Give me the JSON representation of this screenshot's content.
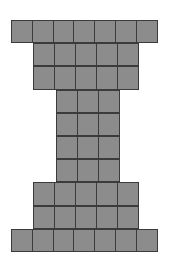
{
  "figure": {
    "name": "i-beam-unit-square-figure",
    "colors": {
      "cell_fill": "#8c8c8c",
      "cell_border": "#3b3b3b",
      "background": "#ffffff"
    },
    "grid": {
      "columns": 7,
      "rows": 10,
      "cell_width_px": 22.43,
      "cell_height_px": 23.2,
      "origin_x_px": 11,
      "origin_y_px": 20
    },
    "total_squares": 46,
    "rows": [
      {
        "row": 1,
        "start_col": 1,
        "cells": 7,
        "label": "top-flange-row-1"
      },
      {
        "row": 2,
        "start_col": 2,
        "cells": 5,
        "label": "top-flange-row-2"
      },
      {
        "row": 3,
        "start_col": 2,
        "cells": 5,
        "label": "top-flange-row-3"
      },
      {
        "row": 4,
        "start_col": 3,
        "cells": 3,
        "label": "web-row-1"
      },
      {
        "row": 5,
        "start_col": 3,
        "cells": 3,
        "label": "web-row-2"
      },
      {
        "row": 6,
        "start_col": 3,
        "cells": 3,
        "label": "web-row-3"
      },
      {
        "row": 7,
        "start_col": 3,
        "cells": 3,
        "label": "web-row-4"
      },
      {
        "row": 8,
        "start_col": 2,
        "cells": 5,
        "label": "bottom-flange-row-1"
      },
      {
        "row": 9,
        "start_col": 2,
        "cells": 5,
        "label": "bottom-flange-row-2"
      },
      {
        "row": 10,
        "start_col": 1,
        "cells": 7,
        "label": "bottom-flange-row-3"
      }
    ]
  }
}
